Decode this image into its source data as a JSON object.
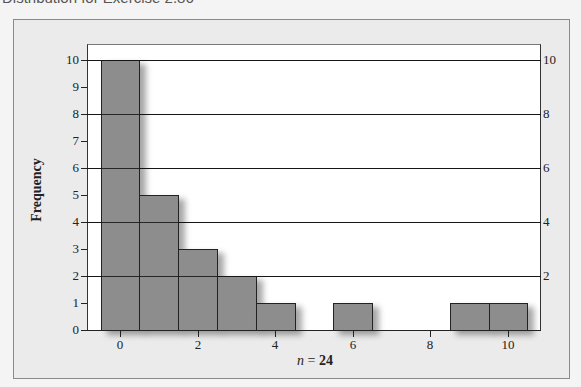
{
  "page": {
    "title": "Distribution for Exercise 2.86"
  },
  "chart_data": {
    "type": "bar",
    "title": "Distribution for Exercise 2.86",
    "xlabel_var": "n",
    "xlabel_eq": " = ",
    "xlabel_value": "24",
    "xlabel": "n = 24",
    "ylabel": "Frequency",
    "categories": [
      0,
      1,
      2,
      3,
      4,
      5,
      6,
      7,
      8,
      9,
      10
    ],
    "values": [
      10,
      5,
      3,
      2,
      1,
      0,
      1,
      0,
      0,
      1,
      1
    ],
    "ylim": [
      0,
      10
    ],
    "xlim": [
      -0.5,
      10.5
    ],
    "y_ticks_left": [
      0,
      1,
      2,
      3,
      4,
      5,
      6,
      7,
      8,
      9,
      10
    ],
    "y_ticks_right": [
      2,
      4,
      6,
      8,
      10
    ],
    "x_ticks": [
      0,
      2,
      4,
      6,
      8,
      10
    ],
    "gridlines_at": [
      2,
      4,
      6,
      8,
      10
    ],
    "grid": true,
    "bar_color": "#8d8d8d",
    "legend": null
  }
}
